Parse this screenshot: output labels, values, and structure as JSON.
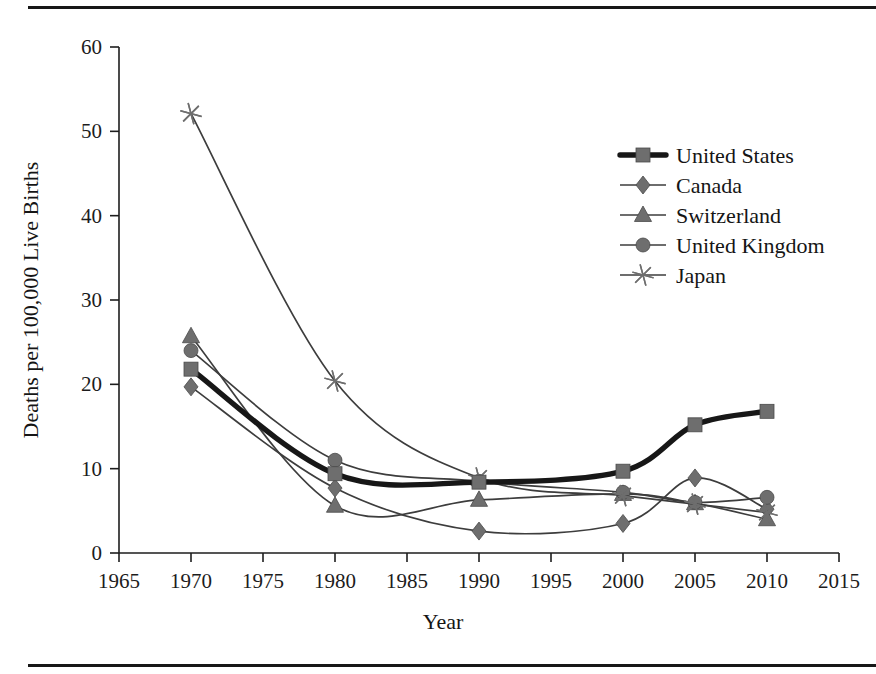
{
  "figure": {
    "top_rule": "horizontal-rule",
    "bottom_rule": "horizontal-rule"
  },
  "axes": {
    "x_title": "Year",
    "y_title": "Deaths per 100,000 Live Births",
    "x_ticks": [
      "1965",
      "1970",
      "1975",
      "1980",
      "1985",
      "1990",
      "1995",
      "2000",
      "2005",
      "2010",
      "2015"
    ],
    "y_ticks": [
      "0",
      "10",
      "20",
      "30",
      "40",
      "50",
      "60"
    ]
  },
  "legend": {
    "items": [
      {
        "label": "United States",
        "marker": "square",
        "emphasis": true
      },
      {
        "label": "Canada",
        "marker": "diamond",
        "emphasis": false
      },
      {
        "label": "Switzerland",
        "marker": "triangle",
        "emphasis": false
      },
      {
        "label": "United Kingdom",
        "marker": "circle",
        "emphasis": false
      },
      {
        "label": "Japan",
        "marker": "star",
        "emphasis": false
      }
    ]
  },
  "colors": {
    "line": "#3d3d3d",
    "line_emphasis": "#171717",
    "marker_fill": "#6e6e6e",
    "axis": "#1e1e1e",
    "text": "#151515",
    "background": "#ffffff"
  },
  "chart_data": {
    "type": "line",
    "title": "",
    "xlabel": "Year",
    "ylabel": "Deaths per 100,000 Live Births",
    "x": [
      1970,
      1980,
      1990,
      2000,
      2005,
      2010
    ],
    "xlim": [
      1965,
      2015
    ],
    "ylim": [
      0,
      60
    ],
    "xticks": [
      1965,
      1970,
      1975,
      1980,
      1985,
      1990,
      1995,
      2000,
      2005,
      2010,
      2015
    ],
    "yticks": [
      0,
      10,
      20,
      30,
      40,
      50,
      60
    ],
    "grid": false,
    "legend_position": "upper right",
    "smoothed": true,
    "series": [
      {
        "name": "United States",
        "marker": "square",
        "emphasis": true,
        "values": [
          21.8,
          9.4,
          8.4,
          9.7,
          15.2,
          16.8
        ]
      },
      {
        "name": "Canada",
        "marker": "diamond",
        "emphasis": false,
        "values": [
          19.7,
          7.7,
          2.6,
          3.5,
          8.9,
          5.2
        ]
      },
      {
        "name": "Switzerland",
        "marker": "triangle",
        "emphasis": false,
        "values": [
          25.7,
          5.6,
          6.3,
          7.0,
          5.9,
          4.0
        ]
      },
      {
        "name": "United Kingdom",
        "marker": "circle",
        "emphasis": false,
        "values": [
          24.0,
          11.0,
          8.5,
          7.2,
          6.0,
          6.6
        ]
      },
      {
        "name": "Japan",
        "marker": "star",
        "emphasis": false,
        "values": [
          52.1,
          20.4,
          8.9,
          6.8,
          5.8,
          4.8
        ]
      }
    ]
  }
}
